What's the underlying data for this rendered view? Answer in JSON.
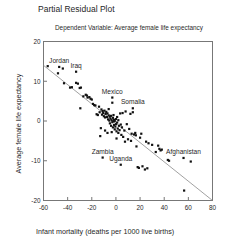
{
  "chart_data": {
    "type": "scatter",
    "title": "Partial Residual Plot",
    "subtitle": "Dependent Variable: Average female life expectancy",
    "xlabel": "Infant mortality (deaths per 1000 live births)",
    "ylabel": "Average female life expectancy",
    "xlim": [
      -60,
      80
    ],
    "ylim": [
      -20,
      20
    ],
    "xticks": [
      -60,
      -40,
      -20,
      0,
      20,
      40,
      60,
      80
    ],
    "yticks": [
      20,
      10,
      0,
      -10,
      -20
    ],
    "xtick_labels": [
      "-60",
      "-40",
      "-20",
      "0",
      "20",
      "40",
      "60",
      "80"
    ],
    "ytick_labels": [
      "20",
      "10",
      "0",
      "-10",
      "-20"
    ],
    "grid": false,
    "legend": false,
    "marker": "square",
    "marker_color": "#111111",
    "fit_line": {
      "type": "linear",
      "from": [
        -60,
        14.0
      ],
      "to": [
        80,
        -20.0
      ],
      "color": "#8a8a8a"
    },
    "annotations": [
      {
        "label": "Jordan",
        "x": -47.0,
        "y": 13.6
      },
      {
        "label": "Iraq",
        "x": -33.0,
        "y": 12.4
      },
      {
        "label": "Mexico",
        "x": -3.0,
        "y": 5.9
      },
      {
        "label": "Somalia",
        "x": 14.0,
        "y": 3.2
      },
      {
        "label": "Zambia",
        "x": -11.0,
        "y": -9.2
      },
      {
        "label": "Uganda",
        "x": 4.0,
        "y": -11.0
      },
      {
        "label": "Afghanistan",
        "x": 56.0,
        "y": -9.3
      }
    ],
    "points": [
      [
        -56.5,
        13.8
      ],
      [
        -48.0,
        12.0
      ],
      [
        -44.0,
        13.2
      ],
      [
        -43.0,
        9.5
      ],
      [
        -38.0,
        8.4
      ],
      [
        -36.5,
        8.5
      ],
      [
        -33.0,
        9.6
      ],
      [
        -31.5,
        9.4
      ],
      [
        -30.0,
        8.3
      ],
      [
        -29.0,
        8.4
      ],
      [
        -29.5,
        3.2
      ],
      [
        -25.0,
        6.6
      ],
      [
        -24.0,
        6.4
      ],
      [
        -23.5,
        5.9
      ],
      [
        -22.0,
        6.0
      ],
      [
        -21.0,
        5.6
      ],
      [
        -19.0,
        4.3
      ],
      [
        -18.0,
        4.0
      ],
      [
        -17.0,
        3.9
      ],
      [
        -16.0,
        1.7
      ],
      [
        -15.0,
        1.5
      ],
      [
        -14.0,
        3.6
      ],
      [
        -13.5,
        2.2
      ],
      [
        -13.0,
        -3.8
      ],
      [
        -12.0,
        2.9
      ],
      [
        -11.5,
        1.6
      ],
      [
        -11.0,
        2.5
      ],
      [
        -10.5,
        2.0
      ],
      [
        -10.0,
        1.2
      ],
      [
        -9.5,
        2.6
      ],
      [
        -9.0,
        0.9
      ],
      [
        -8.5,
        1.8
      ],
      [
        -8.0,
        2.3
      ],
      [
        -7.5,
        1.0
      ],
      [
        -7.0,
        1.9
      ],
      [
        -6.5,
        0.4
      ],
      [
        -6.0,
        1.4
      ],
      [
        -6.0,
        3.0
      ],
      [
        -5.5,
        0.1
      ],
      [
        -5.0,
        1.1
      ],
      [
        -5.0,
        -0.6
      ],
      [
        -4.5,
        0.6
      ],
      [
        -4.0,
        -1.2
      ],
      [
        -4.0,
        1.3
      ],
      [
        -3.5,
        0.2
      ],
      [
        -3.0,
        4.6
      ],
      [
        -3.0,
        -0.3
      ],
      [
        -2.5,
        0.8
      ],
      [
        -2.5,
        -1.6
      ],
      [
        -2.0,
        -0.1
      ],
      [
        -2.0,
        1.5
      ],
      [
        -1.5,
        -1.0
      ],
      [
        -1.5,
        0.3
      ],
      [
        -1.0,
        -2.1
      ],
      [
        -1.0,
        0.0
      ],
      [
        -0.5,
        -1.4
      ],
      [
        0.0,
        0.5
      ],
      [
        0.0,
        -0.8
      ],
      [
        0.5,
        -2.6
      ],
      [
        1.0,
        -0.4
      ],
      [
        1.0,
        1.0
      ],
      [
        1.5,
        -1.9
      ],
      [
        2.0,
        -3.0
      ],
      [
        2.0,
        0.2
      ],
      [
        2.5,
        -1.2
      ],
      [
        3.0,
        -2.3
      ],
      [
        3.5,
        1.9
      ],
      [
        4.0,
        -0.9
      ],
      [
        4.5,
        -3.5
      ],
      [
        5.0,
        -1.6
      ],
      [
        5.5,
        2.0
      ],
      [
        6.0,
        -4.0
      ],
      [
        7.0,
        -2.4
      ],
      [
        7.5,
        -5.2
      ],
      [
        8.0,
        2.4
      ],
      [
        9.0,
        -0.8
      ],
      [
        10.0,
        -4.6
      ],
      [
        11.0,
        -2.0
      ],
      [
        12.0,
        1.8
      ],
      [
        12.5,
        -5.0
      ],
      [
        13.0,
        -3.2
      ],
      [
        14.0,
        2.2
      ],
      [
        15.0,
        -3.4
      ],
      [
        16.0,
        -3.0
      ],
      [
        16.5,
        -3.6
      ],
      [
        17.0,
        -6.4
      ],
      [
        18.0,
        -11.6
      ],
      [
        19.0,
        -11.8
      ],
      [
        20.0,
        -4.2
      ],
      [
        21.0,
        -3.2
      ],
      [
        22.0,
        -11.4
      ],
      [
        24.0,
        -12.2
      ],
      [
        25.0,
        -5.2
      ],
      [
        26.0,
        -11.9
      ],
      [
        27.0,
        -5.6
      ],
      [
        30.0,
        -6.0
      ],
      [
        33.0,
        -7.8
      ],
      [
        35.0,
        -6.2
      ],
      [
        36.0,
        -7.0
      ],
      [
        37.0,
        -7.4
      ],
      [
        38.0,
        -7.2
      ],
      [
        43.0,
        -9.8
      ],
      [
        44.0,
        -10.0
      ],
      [
        56.5,
        -17.5
      ],
      [
        62.0,
        -10.2
      ],
      [
        -20.0,
        5.4
      ],
      [
        -27.0,
        6.2
      ],
      [
        -7.0,
        -3.0
      ],
      [
        -9.0,
        -2.4
      ],
      [
        -12.5,
        -1.8
      ],
      [
        0.5,
        -4.4
      ],
      [
        -3.5,
        -2.8
      ]
    ]
  }
}
